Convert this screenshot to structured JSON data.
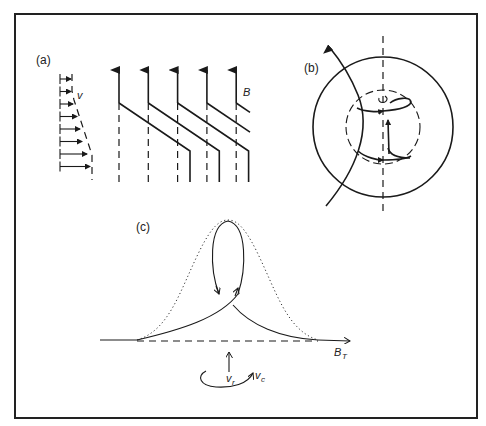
{
  "figure": {
    "panels": [
      {
        "id": "a",
        "label": "(a)",
        "velocity_label": "v",
        "field_label": "B",
        "field_line_count": 5,
        "velocity_arrow_count": 8
      },
      {
        "id": "b",
        "label": "(b)"
      },
      {
        "id": "c",
        "label": "(c)",
        "axis_label": "B",
        "axis_label_sub": "T",
        "vertical_velocity_label": "v",
        "vertical_velocity_sub": "r",
        "rotation_label": "v",
        "rotation_sub": "c"
      }
    ]
  }
}
